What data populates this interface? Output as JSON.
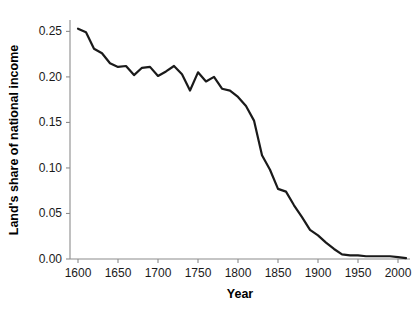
{
  "chart_data": {
    "type": "line",
    "title": "",
    "xlabel": "Year",
    "ylabel": "Land's share of national income",
    "xlim": [
      1590,
      2015
    ],
    "ylim": [
      0.0,
      0.2625
    ],
    "grid": false,
    "legend": null,
    "x_ticks": [
      1600,
      1650,
      1700,
      1750,
      1800,
      1850,
      1900,
      1950,
      2000
    ],
    "x_tick_labels": [
      "1600",
      "1650",
      "1700",
      "1750",
      "1800",
      "1850",
      "1900",
      "1950",
      "2000"
    ],
    "y_ticks": [
      0.0,
      0.05,
      0.1,
      0.15,
      0.2,
      0.25
    ],
    "y_tick_labels": [
      "0.00",
      "0.05",
      "0.10",
      "0.15",
      "0.20",
      "0.25"
    ],
    "series": [
      {
        "name": "Land's share of national income",
        "color": "#1a1a1a",
        "x": [
          1600,
          1610,
          1620,
          1630,
          1640,
          1650,
          1660,
          1670,
          1680,
          1690,
          1700,
          1710,
          1720,
          1730,
          1740,
          1750,
          1760,
          1770,
          1780,
          1790,
          1800,
          1810,
          1820,
          1830,
          1840,
          1850,
          1860,
          1870,
          1880,
          1890,
          1900,
          1910,
          1920,
          1930,
          1940,
          1950,
          1960,
          1970,
          1980,
          1990,
          2000,
          2010
        ],
        "y": [
          0.253,
          0.249,
          0.231,
          0.226,
          0.215,
          0.211,
          0.212,
          0.202,
          0.21,
          0.211,
          0.201,
          0.206,
          0.212,
          0.203,
          0.185,
          0.205,
          0.195,
          0.2,
          0.187,
          0.185,
          0.178,
          0.168,
          0.152,
          0.114,
          0.098,
          0.077,
          0.074,
          0.059,
          0.046,
          0.032,
          0.026,
          0.018,
          0.011,
          0.005,
          0.004,
          0.004,
          0.003,
          0.003,
          0.003,
          0.003,
          0.002,
          0.001
        ]
      }
    ]
  },
  "axes": {
    "x_axis_name": "Year",
    "y_axis_name": "Land's share of national income"
  }
}
